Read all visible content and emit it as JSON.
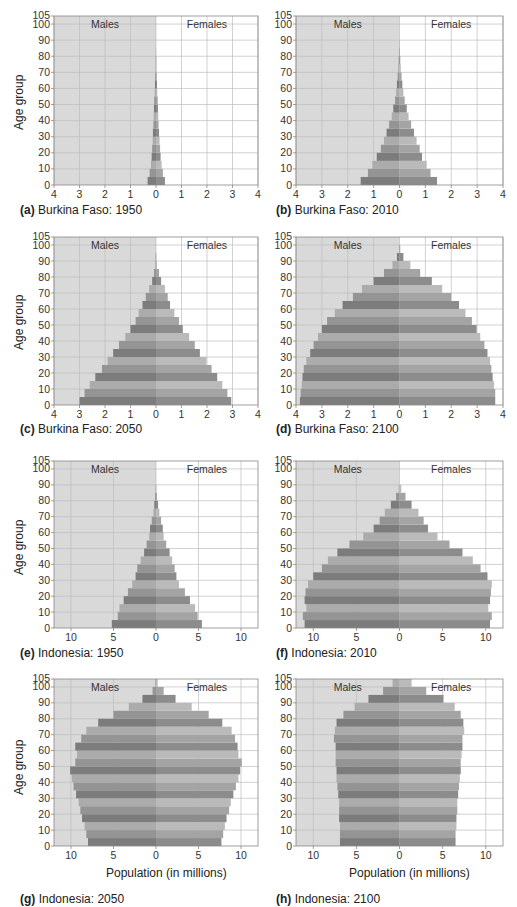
{
  "figure": {
    "y_axis_label": "Age group",
    "x_axis_label": "Population (in millions)",
    "males_label": "Males",
    "females_label": "Females",
    "colors": {
      "male_background": "#d9d9d9",
      "female_background": "#ffffff",
      "grid": "#bdbdbd",
      "frame": "#888888",
      "male_bars": [
        "#7c7c7c",
        "#949494",
        "#ababab"
      ],
      "female_bars": [
        "#8c8c8c",
        "#a4a4a4",
        "#bababa"
      ]
    }
  },
  "captions": [
    {
      "letter": "(a)",
      "text": "Burkina Faso: 1950"
    },
    {
      "letter": "(b)",
      "text": "Burkina Faso: 2010"
    },
    {
      "letter": "(c)",
      "text": "Burkina Faso: 2050"
    },
    {
      "letter": "(d)",
      "text": "Burkina Faso: 2100"
    },
    {
      "letter": "(e)",
      "text": "Indonesia: 1950"
    },
    {
      "letter": "(f)",
      "text": "Indonesia: 2010"
    },
    {
      "letter": "(g)",
      "text": "Indonesia: 2050"
    },
    {
      "letter": "(h)",
      "text": "Indonesia: 2100"
    }
  ],
  "chart_data": [
    {
      "type": "bar",
      "orientation": "horizontal-pyramid",
      "title": "(a) Burkina Faso: 1950",
      "ylabel": "Age group",
      "xlabel": "",
      "age_groups": [
        0,
        5,
        10,
        15,
        20,
        25,
        30,
        35,
        40,
        45,
        50,
        55,
        60,
        65,
        70,
        75,
        80,
        85,
        90,
        95,
        100
      ],
      "y_ticks": [
        0,
        10,
        20,
        30,
        40,
        50,
        60,
        70,
        80,
        90,
        100,
        105
      ],
      "x_ticks": [
        4,
        3,
        2,
        1,
        0,
        1,
        2,
        3,
        4
      ],
      "xlim": [
        -4,
        4
      ],
      "ylim": [
        0,
        105
      ],
      "series": [
        {
          "name": "Males",
          "values": [
            0.33,
            0.25,
            0.2,
            0.17,
            0.15,
            0.13,
            0.12,
            0.1,
            0.09,
            0.08,
            0.07,
            0.05,
            0.04,
            0.03,
            0.02,
            0.01,
            0.005,
            0,
            0,
            0,
            0
          ]
        },
        {
          "name": "Females",
          "values": [
            0.35,
            0.27,
            0.22,
            0.18,
            0.16,
            0.14,
            0.12,
            0.1,
            0.09,
            0.08,
            0.07,
            0.05,
            0.04,
            0.03,
            0.02,
            0.01,
            0.005,
            0,
            0,
            0,
            0
          ]
        }
      ],
      "grid": true
    },
    {
      "type": "bar",
      "orientation": "horizontal-pyramid",
      "title": "(b) Burkina Faso: 2010",
      "ylabel": "",
      "xlabel": "",
      "age_groups": [
        0,
        5,
        10,
        15,
        20,
        25,
        30,
        35,
        40,
        45,
        50,
        55,
        60,
        65,
        70,
        75,
        80,
        85,
        90,
        95,
        100
      ],
      "y_ticks": [
        0,
        10,
        20,
        30,
        40,
        50,
        60,
        70,
        80,
        90,
        100,
        105
      ],
      "x_ticks": [
        4,
        3,
        2,
        1,
        0,
        1,
        2,
        3,
        4
      ],
      "xlim": [
        -4,
        4
      ],
      "ylim": [
        0,
        105
      ],
      "series": [
        {
          "name": "Males",
          "values": [
            1.5,
            1.22,
            1.05,
            0.88,
            0.72,
            0.6,
            0.5,
            0.4,
            0.3,
            0.24,
            0.17,
            0.13,
            0.1,
            0.07,
            0.05,
            0.03,
            0.02,
            0.01,
            0,
            0,
            0
          ]
        },
        {
          "name": "Females",
          "values": [
            1.45,
            1.2,
            1.05,
            0.87,
            0.78,
            0.66,
            0.56,
            0.45,
            0.35,
            0.28,
            0.2,
            0.15,
            0.11,
            0.08,
            0.05,
            0.03,
            0.02,
            0.01,
            0,
            0,
            0
          ]
        }
      ],
      "grid": true
    },
    {
      "type": "bar",
      "orientation": "horizontal-pyramid",
      "title": "(c) Burkina Faso: 2050",
      "ylabel": "Age group",
      "xlabel": "",
      "age_groups": [
        0,
        5,
        10,
        15,
        20,
        25,
        30,
        35,
        40,
        45,
        50,
        55,
        60,
        65,
        70,
        75,
        80,
        85,
        90,
        95,
        100
      ],
      "y_ticks": [
        0,
        10,
        20,
        30,
        40,
        50,
        60,
        70,
        80,
        90,
        100,
        105
      ],
      "x_ticks": [
        4,
        3,
        2,
        1,
        0,
        1,
        2,
        3,
        4
      ],
      "xlim": [
        -4,
        4
      ],
      "ylim": [
        0,
        105
      ],
      "series": [
        {
          "name": "Males",
          "values": [
            3.0,
            2.8,
            2.6,
            2.38,
            2.12,
            1.9,
            1.68,
            1.45,
            1.2,
            1.0,
            0.8,
            0.68,
            0.53,
            0.4,
            0.27,
            0.15,
            0.08,
            0.03,
            0.01,
            0,
            0
          ]
        },
        {
          "name": "Females",
          "values": [
            2.95,
            2.8,
            2.6,
            2.4,
            2.18,
            1.98,
            1.72,
            1.52,
            1.3,
            1.05,
            0.9,
            0.72,
            0.55,
            0.46,
            0.35,
            0.2,
            0.12,
            0.04,
            0.01,
            0,
            0
          ]
        }
      ],
      "grid": true
    },
    {
      "type": "bar",
      "orientation": "horizontal-pyramid",
      "title": "(d) Burkina Faso: 2100",
      "ylabel": "",
      "xlabel": "",
      "age_groups": [
        0,
        5,
        10,
        15,
        20,
        25,
        30,
        35,
        40,
        45,
        50,
        55,
        60,
        65,
        70,
        75,
        80,
        85,
        90,
        95,
        100
      ],
      "y_ticks": [
        0,
        10,
        20,
        30,
        40,
        50,
        60,
        70,
        80,
        90,
        100,
        105
      ],
      "x_ticks": [
        4,
        3,
        2,
        1,
        0,
        1,
        2,
        3,
        4
      ],
      "xlim": [
        -4,
        4
      ],
      "ylim": [
        0,
        105
      ],
      "series": [
        {
          "name": "Males",
          "values": [
            3.85,
            3.82,
            3.78,
            3.75,
            3.7,
            3.6,
            3.45,
            3.32,
            3.15,
            3.0,
            2.8,
            2.5,
            2.2,
            1.8,
            1.45,
            1.0,
            0.6,
            0.27,
            0.1,
            0.02,
            0
          ]
        },
        {
          "name": "Females",
          "values": [
            3.7,
            3.7,
            3.65,
            3.6,
            3.55,
            3.5,
            3.4,
            3.28,
            3.12,
            2.98,
            2.8,
            2.55,
            2.3,
            2.0,
            1.65,
            1.25,
            0.8,
            0.42,
            0.15,
            0.03,
            0
          ]
        }
      ],
      "grid": true
    },
    {
      "type": "bar",
      "orientation": "horizontal-pyramid",
      "title": "(e) Indonesia: 1950",
      "ylabel": "Age group",
      "xlabel": "",
      "age_groups": [
        0,
        5,
        10,
        15,
        20,
        25,
        30,
        35,
        40,
        45,
        50,
        55,
        60,
        65,
        70,
        75,
        80,
        85,
        90,
        95,
        100
      ],
      "y_ticks": [
        0,
        10,
        20,
        30,
        40,
        50,
        60,
        70,
        80,
        90,
        100,
        105
      ],
      "x_ticks": [
        10,
        5,
        0,
        5,
        10
      ],
      "xlim": [
        -12,
        12
      ],
      "ylim": [
        0,
        105
      ],
      "series": [
        {
          "name": "Males",
          "values": [
            5.2,
            4.5,
            4.3,
            3.8,
            3.3,
            2.8,
            2.4,
            2.2,
            1.8,
            1.4,
            1.1,
            0.8,
            0.7,
            0.5,
            0.3,
            0.2,
            0.1,
            0.05,
            0,
            0,
            0
          ]
        },
        {
          "name": "Females",
          "values": [
            5.4,
            4.9,
            4.6,
            4.0,
            3.4,
            2.7,
            2.4,
            2.2,
            1.9,
            1.6,
            1.2,
            0.9,
            0.8,
            0.6,
            0.4,
            0.25,
            0.12,
            0.05,
            0,
            0,
            0
          ]
        }
      ],
      "grid": true
    },
    {
      "type": "bar",
      "orientation": "horizontal-pyramid",
      "title": "(f) Indonesia: 2010",
      "ylabel": "",
      "xlabel": "",
      "age_groups": [
        0,
        5,
        10,
        15,
        20,
        25,
        30,
        35,
        40,
        45,
        50,
        55,
        60,
        65,
        70,
        75,
        80,
        85,
        90,
        95,
        100
      ],
      "y_ticks": [
        0,
        10,
        20,
        30,
        40,
        50,
        60,
        70,
        80,
        90,
        100,
        105
      ],
      "x_ticks": [
        10,
        5,
        0,
        5,
        10
      ],
      "xlim": [
        -12,
        12
      ],
      "ylim": [
        0,
        105
      ],
      "series": [
        {
          "name": "Males",
          "values": [
            11.0,
            11.2,
            10.8,
            11.0,
            10.9,
            10.6,
            10.0,
            9.0,
            8.3,
            7.2,
            5.8,
            4.2,
            3.0,
            2.3,
            1.7,
            1.0,
            0.4,
            0.1,
            0,
            0,
            0
          ]
        },
        {
          "name": "Females",
          "values": [
            10.5,
            10.7,
            10.3,
            10.5,
            10.6,
            10.7,
            10.2,
            9.4,
            8.5,
            7.3,
            5.8,
            4.4,
            3.3,
            2.8,
            2.2,
            1.4,
            0.7,
            0.2,
            0,
            0,
            0
          ]
        }
      ],
      "grid": true
    },
    {
      "type": "bar",
      "orientation": "horizontal-pyramid",
      "title": "(g) Indonesia: 2050",
      "ylabel": "Age group",
      "xlabel": "Population (in millions)",
      "age_groups": [
        0,
        5,
        10,
        15,
        20,
        25,
        30,
        35,
        40,
        45,
        50,
        55,
        60,
        65,
        70,
        75,
        80,
        85,
        90,
        95,
        100
      ],
      "y_ticks": [
        0,
        10,
        20,
        30,
        40,
        50,
        60,
        70,
        80,
        90,
        100,
        105
      ],
      "x_ticks": [
        10,
        5,
        0,
        5,
        10
      ],
      "xlim": [
        -12,
        12
      ],
      "ylim": [
        0,
        105
      ],
      "series": [
        {
          "name": "Males",
          "values": [
            8.0,
            8.2,
            8.4,
            8.7,
            8.9,
            9.1,
            9.4,
            9.7,
            9.9,
            10.1,
            9.5,
            9.3,
            9.5,
            8.8,
            8.2,
            6.8,
            5.0,
            3.2,
            1.6,
            0.4,
            0.1
          ]
        },
        {
          "name": "Females",
          "values": [
            7.7,
            7.9,
            8.1,
            8.3,
            8.6,
            8.8,
            9.1,
            9.4,
            9.7,
            9.9,
            10.1,
            9.7,
            9.6,
            9.3,
            8.9,
            7.8,
            6.2,
            4.2,
            2.3,
            0.9,
            0.2
          ]
        }
      ],
      "grid": true
    },
    {
      "type": "bar",
      "orientation": "horizontal-pyramid",
      "title": "(h) Indonesia: 2100",
      "ylabel": "",
      "xlabel": "Population (in millions)",
      "age_groups": [
        0,
        5,
        10,
        15,
        20,
        25,
        30,
        35,
        40,
        45,
        50,
        55,
        60,
        65,
        70,
        75,
        80,
        85,
        90,
        95,
        100
      ],
      "y_ticks": [
        0,
        10,
        20,
        30,
        40,
        50,
        60,
        70,
        80,
        90,
        100,
        105
      ],
      "x_ticks": [
        10,
        5,
        0,
        5,
        10
      ],
      "xlim": [
        -12,
        12
      ],
      "ylim": [
        0,
        105
      ],
      "series": [
        {
          "name": "Males",
          "values": [
            6.9,
            6.9,
            6.9,
            7.0,
            7.0,
            7.0,
            7.1,
            7.2,
            7.3,
            7.3,
            7.4,
            7.4,
            7.4,
            7.6,
            7.5,
            7.3,
            6.5,
            5.2,
            3.6,
            1.9,
            0.8
          ]
        },
        {
          "name": "Females",
          "values": [
            6.5,
            6.5,
            6.6,
            6.6,
            6.7,
            6.7,
            6.8,
            6.9,
            7.0,
            7.1,
            7.1,
            7.2,
            7.3,
            7.3,
            7.5,
            7.4,
            7.1,
            6.4,
            5.1,
            3.1,
            1.4
          ]
        }
      ],
      "grid": true
    }
  ]
}
